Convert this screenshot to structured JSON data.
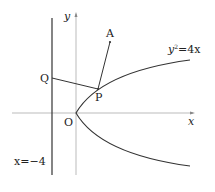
{
  "diagram": {
    "type": "parabola-geometry",
    "curve": {
      "equation": "y²=4x",
      "label_base": "y",
      "label_exp": "2",
      "label_rest": "=4x"
    },
    "directrix": {
      "label": "x=−4"
    },
    "axes": {
      "x_label": "x",
      "y_label": "y"
    },
    "points": {
      "origin": "O",
      "P": "P",
      "Q": "Q",
      "A": "A"
    },
    "colors": {
      "line": "#333333",
      "axis": "#999999",
      "text": "#222222"
    }
  }
}
